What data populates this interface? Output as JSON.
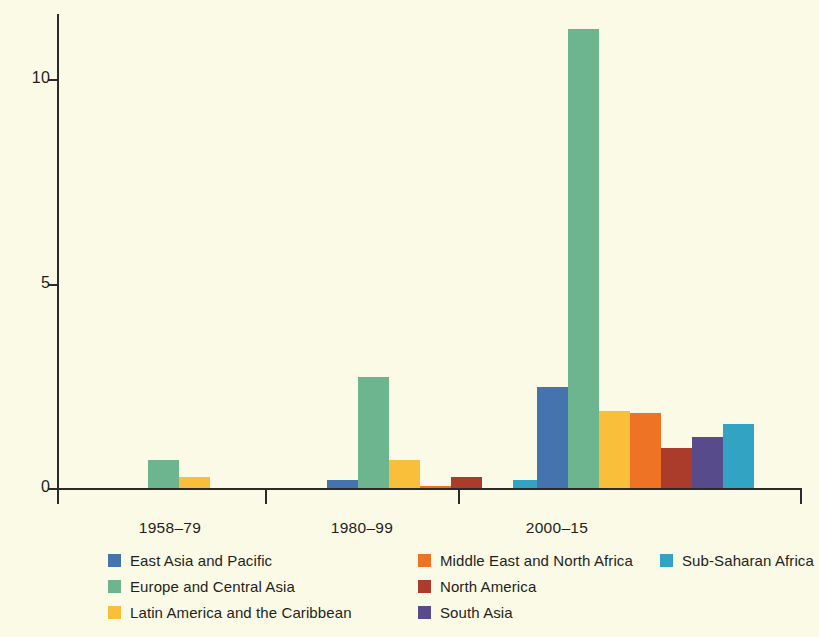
{
  "chart_data": {
    "type": "bar",
    "title": "",
    "subtitle": "",
    "xlabel": "",
    "ylabel": "",
    "categories": [
      "1958–79",
      "1980–99",
      "2000–15"
    ],
    "ylim": [
      0,
      11.6
    ],
    "yticks": [
      0,
      5,
      10
    ],
    "ytick_labels": [
      "0",
      "5",
      "10"
    ],
    "grid": false,
    "legend_position": "bottom",
    "series": [
      {
        "name": "East Asia and Pacific",
        "color": "#4473ad",
        "values": [
          0,
          0.2,
          2.48
        ]
      },
      {
        "name": "Europe and Central Asia",
        "color": "#6cb58e",
        "values": [
          0.68,
          2.72,
          11.24
        ]
      },
      {
        "name": "Latin America and the Caribbean",
        "color": "#f9bf3b",
        "values": [
          0.28,
          0.68,
          1.88
        ]
      },
      {
        "name": "Middle East and North Africa",
        "color": "#ee7325",
        "values": [
          0,
          0.06,
          1.83
        ]
      },
      {
        "name": "North America",
        "color": "#ab3c2c",
        "values": [
          0,
          0.28,
          0.98
        ]
      },
      {
        "name": "South Asia",
        "color": "#574b8c",
        "values": [
          0,
          0,
          1.26
        ]
      },
      {
        "name": "Sub-Saharan Africa",
        "color": "#33a3c4",
        "values": [
          0,
          0.2,
          1.57
        ]
      }
    ]
  },
  "axis": {
    "y_tick_labels": [
      "0",
      "5",
      "10"
    ]
  },
  "groups": [
    {
      "label": "1958–79"
    },
    {
      "label": "1980–99"
    },
    {
      "label": "2000–15"
    }
  ],
  "legend": {
    "items": [
      {
        "label": "East Asia and Pacific",
        "color": "#4473ad"
      },
      {
        "label": "Europe and Central Asia",
        "color": "#6cb58e"
      },
      {
        "label": "Latin America and the Caribbean",
        "color": "#f9bf3b"
      },
      {
        "label": "Middle East and North Africa",
        "color": "#ee7325"
      },
      {
        "label": "North America",
        "color": "#ab3c2c"
      },
      {
        "label": "South Asia",
        "color": "#574b8c"
      },
      {
        "label": "Sub-Saharan Africa",
        "color": "#33a3c4"
      }
    ]
  },
  "colors": {
    "background": "#fbfae6",
    "axis": "#2b2b2b",
    "text": "#231f20"
  }
}
